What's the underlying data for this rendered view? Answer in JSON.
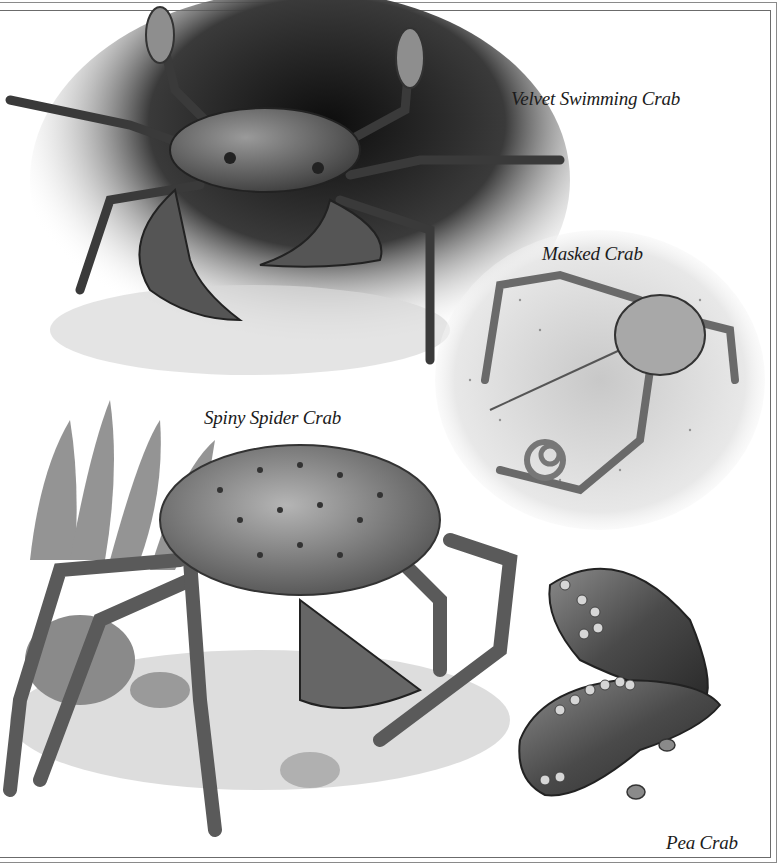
{
  "plate": {
    "captions": {
      "velvet": "Velvet Swimming Crab",
      "masked": "Masked Crab",
      "spiny": "Spiny Spider Crab",
      "pea": "Pea Crab"
    }
  },
  "palette": {
    "background": "#ffffff",
    "ink": "#1b1b1b",
    "dark_shadow": "#111111",
    "mid_gray": "#7a7a7a",
    "light_gray": "#cfcfcf"
  }
}
